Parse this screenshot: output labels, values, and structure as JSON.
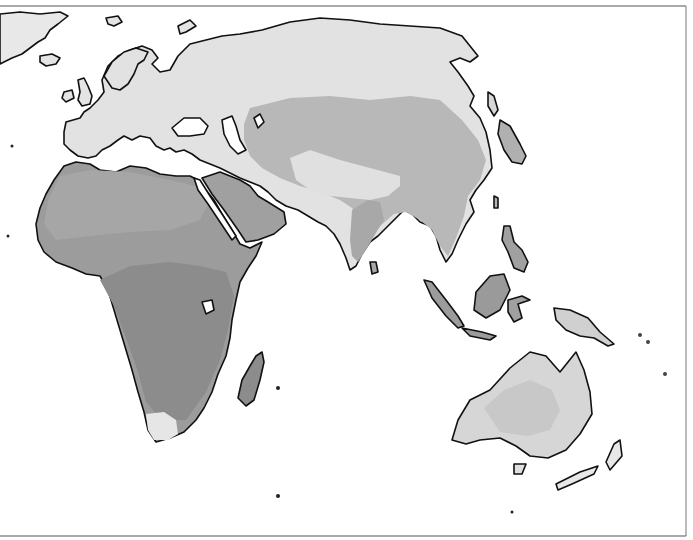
{
  "map": {
    "type": "thematic-grayscale",
    "projection_region": "Eastern Hemisphere: Europe, Africa, Asia, Australia",
    "labels": [],
    "colors": {
      "ocean": "#ffffff",
      "coastline": "#111111",
      "frame": "#555555",
      "class_lightest": "#e4e4e4",
      "class_light": "#d2d2d2",
      "class_medium": "#b4b4b4",
      "class_dark": "#9a9a9a",
      "class_darkest": "#8a8a8a"
    },
    "regions": [
      {
        "name": "Greenland",
        "class": "class_light"
      },
      {
        "name": "Europe",
        "class": "class_lightest"
      },
      {
        "name": "Northern Asia / Siberia",
        "class": "class_lightest"
      },
      {
        "name": "Central Asia",
        "class": "class_medium"
      },
      {
        "name": "Tibet / Himalaya",
        "class": "class_lightest"
      },
      {
        "name": "China / Southeast Asia",
        "class": "class_medium"
      },
      {
        "name": "Arabia",
        "class": "class_dark"
      },
      {
        "name": "North Africa / Sahara",
        "class": "class_dark"
      },
      {
        "name": "Central & Southern Africa",
        "class": "class_darkest"
      },
      {
        "name": "South Africa Cape",
        "class": "class_lightest"
      },
      {
        "name": "Madagascar",
        "class": "class_darkest"
      },
      {
        "name": "India",
        "class": "class_medium"
      },
      {
        "name": "Indonesia / Borneo",
        "class": "class_dark"
      },
      {
        "name": "New Guinea",
        "class": "class_light"
      },
      {
        "name": "Australia",
        "class": "class_light"
      },
      {
        "name": "New Zealand",
        "class": "class_lightest"
      }
    ]
  }
}
